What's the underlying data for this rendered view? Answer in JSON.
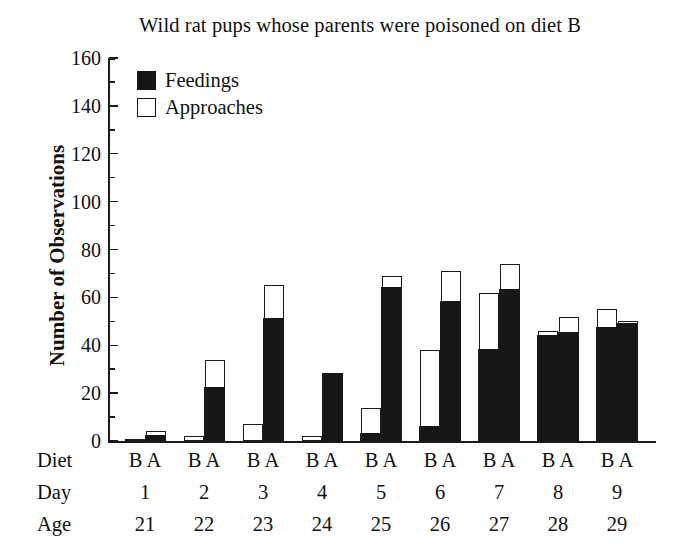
{
  "chart": {
    "title": "Wild rat pups whose parents were poisoned on diet B",
    "ylabel": "Number of Observations",
    "legend": [
      {
        "key": "feedings",
        "label": "Feedings",
        "swatch": "filled-square",
        "color": "#171717"
      },
      {
        "key": "approaches",
        "label": "Approaches",
        "swatch": "open-square",
        "color": "#ffffff"
      }
    ],
    "axis_rows": [
      {
        "key": "diet",
        "title": "Diet"
      },
      {
        "key": "day",
        "title": "Day"
      },
      {
        "key": "age",
        "title": "Age"
      }
    ],
    "ytick_labels": [
      "0",
      "20",
      "40",
      "60",
      "80",
      "100",
      "120",
      "140",
      "160"
    ]
  },
  "chart_data": {
    "type": "bar",
    "subtype": "stacked-grouped",
    "title": "Wild rat pups whose parents were poisoned on diet B",
    "xlabel": "",
    "ylabel": "Number of Observations",
    "ylim": [
      0,
      160
    ],
    "ytick_major": [
      0,
      20,
      40,
      60,
      80,
      100,
      120,
      140,
      160
    ],
    "ytick_minor_step": 10,
    "grid": false,
    "legend_position": "top-left-inside",
    "series": [
      {
        "name": "Feedings",
        "color": "#171717"
      },
      {
        "name": "Approaches",
        "color": "#ffffff"
      }
    ],
    "groups": [
      {
        "day": "1",
        "age": "21",
        "bars": [
          {
            "diet": "B",
            "feedings": 0,
            "approaches": 1,
            "total": 1
          },
          {
            "diet": "A",
            "feedings": 2,
            "approaches": 2,
            "total": 4
          }
        ]
      },
      {
        "day": "2",
        "age": "22",
        "bars": [
          {
            "diet": "B",
            "feedings": 0,
            "approaches": 2,
            "total": 2
          },
          {
            "diet": "A",
            "feedings": 22,
            "approaches": 12,
            "total": 34
          }
        ]
      },
      {
        "day": "3",
        "age": "23",
        "bars": [
          {
            "diet": "B",
            "feedings": 0,
            "approaches": 7,
            "total": 7
          },
          {
            "diet": "A",
            "feedings": 51,
            "approaches": 14,
            "total": 65
          }
        ]
      },
      {
        "day": "4",
        "age": "24",
        "bars": [
          {
            "diet": "B",
            "feedings": 0,
            "approaches": 2,
            "total": 2
          },
          {
            "diet": "A",
            "feedings": 28,
            "approaches": 0,
            "total": 28
          }
        ]
      },
      {
        "day": "5",
        "age": "25",
        "bars": [
          {
            "diet": "B",
            "feedings": 3,
            "approaches": 11,
            "total": 14
          },
          {
            "diet": "A",
            "feedings": 64,
            "approaches": 5,
            "total": 69
          }
        ]
      },
      {
        "day": "6",
        "age": "26",
        "bars": [
          {
            "diet": "B",
            "feedings": 6,
            "approaches": 32,
            "total": 38
          },
          {
            "diet": "A",
            "feedings": 58,
            "approaches": 13,
            "total": 71
          }
        ]
      },
      {
        "day": "7",
        "age": "27",
        "bars": [
          {
            "diet": "B",
            "feedings": 38,
            "approaches": 24,
            "total": 62
          },
          {
            "diet": "A",
            "feedings": 63,
            "approaches": 11,
            "total": 74
          }
        ]
      },
      {
        "day": "8",
        "age": "28",
        "bars": [
          {
            "diet": "B",
            "feedings": 44,
            "approaches": 2,
            "total": 46
          },
          {
            "diet": "A",
            "feedings": 45,
            "approaches": 7,
            "total": 52
          }
        ]
      },
      {
        "day": "9",
        "age": "29",
        "bars": [
          {
            "diet": "B",
            "feedings": 47,
            "approaches": 8,
            "total": 55
          },
          {
            "diet": "A",
            "feedings": 49,
            "approaches": 1,
            "total": 50
          }
        ]
      }
    ]
  }
}
